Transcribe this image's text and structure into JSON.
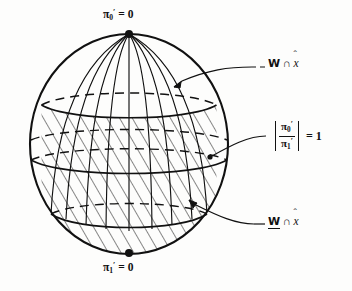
{
  "figure": {
    "name": "sphere-region-diagram",
    "background_color": "#fdfdfc",
    "ink_color": "#111111"
  },
  "sphere": {
    "center_x": 129,
    "center_y": 144,
    "radius_x": 99,
    "radius_y": 110,
    "outline_color": "#111111",
    "hatch_angle_deg": 30,
    "hatch_description": "diagonal line shading over lower region"
  },
  "poles": {
    "top": {
      "marker": "filled-dot",
      "label_symbol": "π",
      "label_subscript": "0",
      "label_prime": "′",
      "label_equals": "= 0",
      "label_full": "π₀′ = 0"
    },
    "bottom": {
      "marker": "filled-dot",
      "label_symbol": "π",
      "label_subscript": "1",
      "label_prime": "′",
      "label_equals": "= 0",
      "label_full": "π₁′ = 0"
    }
  },
  "annotations": {
    "upper_set": {
      "w_symbol": "W",
      "intersect_symbol": "∩",
      "x_symbol": "x",
      "hat_symbol": "ˆ",
      "full": "W ∩ x̂",
      "style": "plain-W",
      "leader": "dashed-then-solid curve to upper latitude circle"
    },
    "ratio": {
      "numerator_symbol": "π",
      "numerator_subscript": "0",
      "numerator_prime": "′",
      "denominator_symbol": "π",
      "denominator_subscript": "1",
      "denominator_prime": "′",
      "equals": "= 1",
      "full": "|π₀′ / π₁′| = 1",
      "leader": "solid curve to middle latitude circle"
    },
    "lower_set": {
      "w_symbol": "W",
      "intersect_symbol": "∩",
      "x_symbol": "x",
      "hat_symbol": "ˆ",
      "full": "W̲ ∩ x̂",
      "style": "underlined-W",
      "leader": "solid curve to lower hatched cap"
    }
  }
}
